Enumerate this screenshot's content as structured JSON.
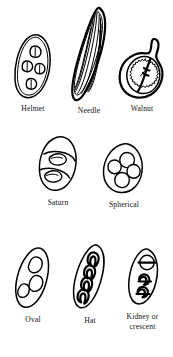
{
  "plate": {
    "title": "Crystal shape types",
    "background_color": "#ffffff",
    "ink_color": "#000000",
    "rows": 3,
    "figure_count": 8
  },
  "figures": [
    {
      "id": "helmet",
      "label": "Helmet",
      "row": 1,
      "col": 1,
      "shape": "elongated-oval-with-4-helmet-inclusions",
      "inclusion_count": 4
    },
    {
      "id": "needle",
      "label": "Needle",
      "row": 1,
      "col": 2,
      "shape": "long-narrow-spindle-with-striations",
      "inclusion_count": 0
    },
    {
      "id": "walnut",
      "label": "Walnut",
      "row": 1,
      "col": 3,
      "shape": "round-body-with-stalk-and-serrated-ring",
      "inclusion_count": 1
    },
    {
      "id": "saturn",
      "label": "Saturn",
      "row": 2,
      "col": 1,
      "shape": "oval-with-2-ringed-lens-inclusions",
      "inclusion_count": 2
    },
    {
      "id": "spherical",
      "label": "Spherical",
      "row": 2,
      "col": 2,
      "shape": "egg-outline-with-4-round-inclusions",
      "inclusion_count": 4
    },
    {
      "id": "oval",
      "label": "Oval",
      "row": 3,
      "col": 1,
      "shape": "tilted-oval-with-3-oval-inclusions",
      "inclusion_count": 3
    },
    {
      "id": "hat",
      "label": "Hat",
      "row": 3,
      "col": 2,
      "shape": "tilted-ellipse-with-4-arch-inclusions",
      "inclusion_count": 4
    },
    {
      "id": "kidney",
      "label": "Kidney or\ncrescent",
      "row": 3,
      "col": 3,
      "shape": "oval-with-circle-and-crescent-inclusions",
      "inclusion_count": 3
    }
  ]
}
